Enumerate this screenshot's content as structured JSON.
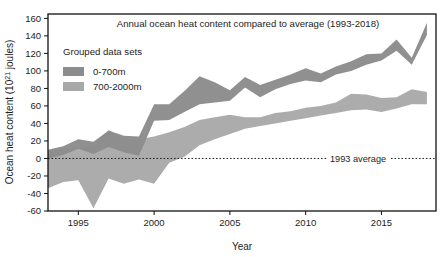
{
  "chart_data": {
    "type": "area",
    "title": "Annual ocean heat content compared to average (1993-2018)",
    "xlabel": "Year",
    "ylabel": "Ocean heat content (10²¹ joules)",
    "xlim": [
      1993,
      2018.6
    ],
    "ylim": [
      -60,
      165
    ],
    "xticks": [
      1995,
      2000,
      2005,
      2010,
      2015
    ],
    "xtick_labels": [
      "1995",
      "2000",
      "2005",
      "2010",
      "2015"
    ],
    "yticks": [
      -60,
      -40,
      -20,
      0,
      20,
      40,
      60,
      80,
      100,
      120,
      140,
      160
    ],
    "ytick_labels": [
      "-60",
      "-40",
      "-20",
      "0",
      "20",
      "40",
      "60",
      "80",
      "100",
      "120",
      "140",
      "160"
    ],
    "grid": false,
    "legend": {
      "position": "upper-left-inside",
      "title": "Grouped data sets",
      "entries": [
        {
          "label": "0-700m",
          "color": "#8c8c8c"
        },
        {
          "label": "700-2000m",
          "color": "#a8a8a8"
        }
      ]
    },
    "annotations": [
      {
        "label": "1993 average",
        "y": 0,
        "style": "dotted-horizontal-line"
      }
    ],
    "x": [
      1993,
      1994,
      1995,
      1996,
      1997,
      1998,
      1999,
      2000,
      2001,
      2002,
      2003,
      2004,
      2005,
      2006,
      2007,
      2008,
      2009,
      2010,
      2011,
      2012,
      2013,
      2014,
      2015,
      2016,
      2017,
      2018
    ],
    "series": [
      {
        "name": "0-700m",
        "type": "band",
        "color": "#8c8c8c",
        "upper": [
          10,
          14,
          22,
          19,
          32,
          26,
          25,
          62,
          62,
          77,
          94,
          87,
          78,
          93,
          84,
          90,
          96,
          103,
          97,
          105,
          111,
          119,
          120,
          136,
          115,
          155
        ],
        "lower": [
          0,
          4,
          11,
          5,
          13,
          7,
          3,
          43,
          44,
          53,
          62,
          64,
          66,
          81,
          70,
          79,
          85,
          89,
          87,
          96,
          100,
          107,
          112,
          123,
          107,
          141
        ]
      },
      {
        "name": "700-2000m",
        "type": "band",
        "color": "#a8a8a8",
        "upper": [
          8,
          11,
          12,
          14,
          32,
          21,
          22,
          25,
          30,
          36,
          44,
          47,
          50,
          47,
          47,
          52,
          54,
          58,
          60,
          64,
          74,
          73,
          69,
          70,
          79,
          76
        ],
        "lower": [
          -34,
          -27,
          -25,
          -57,
          -23,
          -29,
          -24,
          -29,
          -5,
          2,
          15,
          22,
          28,
          34,
          37,
          40,
          43,
          46,
          49,
          52,
          55,
          56,
          53,
          57,
          62,
          62
        ]
      }
    ],
    "center_lines": [
      {
        "name": "0-700m center",
        "values": [
          5,
          9,
          17,
          12,
          22,
          16,
          14,
          52,
          53,
          65,
          78,
          75,
          72,
          87,
          77,
          84,
          90,
          96,
          92,
          100,
          105,
          113,
          116,
          129,
          111,
          148
        ]
      },
      {
        "name": "700-2000m center",
        "values": [
          -13,
          -8,
          -7,
          -21,
          4,
          -4,
          -1,
          -2,
          12,
          19,
          29,
          34,
          39,
          40,
          42,
          46,
          48,
          52,
          54,
          58,
          64,
          64,
          61,
          63,
          70,
          69
        ]
      }
    ]
  }
}
